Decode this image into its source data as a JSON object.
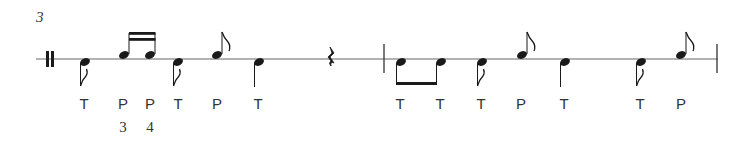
{
  "measure_number": "3",
  "staff": {
    "line_color": "#555555",
    "note_color": "#1a1a1a"
  },
  "labels": [
    {
      "text": "T",
      "x": 84
    },
    {
      "text": "P",
      "x": 123
    },
    {
      "text": "P",
      "x": 150
    },
    {
      "text": "T",
      "x": 178
    },
    {
      "text": "P",
      "x": 217
    },
    {
      "text": "T",
      "x": 258
    },
    {
      "text": "T",
      "x": 400
    },
    {
      "text": "T",
      "x": 440
    },
    {
      "text": "T",
      "x": 481
    },
    {
      "text": "P",
      "x": 521
    },
    {
      "text": "T",
      "x": 564
    },
    {
      "text": "T",
      "x": 640
    },
    {
      "text": "P",
      "x": 681
    }
  ],
  "finger_numbers": [
    {
      "text": "3",
      "x": 123
    },
    {
      "text": "4",
      "x": 150
    }
  ]
}
